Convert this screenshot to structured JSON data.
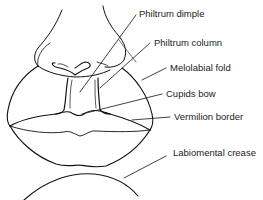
{
  "diagram": {
    "type": "anatomical line drawing",
    "stroke_color": "#111111",
    "labels": [
      {
        "id": "philtrum-dimple",
        "text": "Philtrum dimple",
        "x": 139,
        "y": 9
      },
      {
        "id": "philtrum-column",
        "text": "Philtrum column",
        "x": 154,
        "y": 38
      },
      {
        "id": "melolabial-fold",
        "text": "Melolabial fold",
        "x": 170,
        "y": 63
      },
      {
        "id": "cupids-bow",
        "text": "Cupids bow",
        "x": 166,
        "y": 89
      },
      {
        "id": "vermilion-border",
        "text": "Vermilion border",
        "x": 174,
        "y": 112
      },
      {
        "id": "labiomental-crease",
        "text": "Labiomental crease",
        "x": 173,
        "y": 148
      }
    ]
  }
}
